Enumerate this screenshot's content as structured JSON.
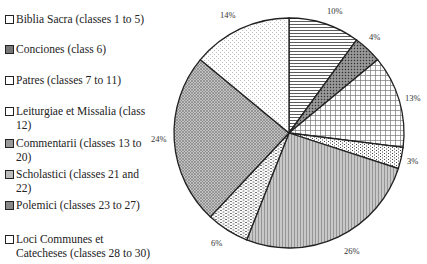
{
  "chart_data": {
    "type": "pie",
    "title": "",
    "start_angle": "12 o'clock, clockwise",
    "legend_position": "left",
    "slices": [
      {
        "label": "Biblia Sacra (classes 1 to 5)",
        "value": 10,
        "value_label": "10%",
        "pattern": "horizontal-lines",
        "swatch": "#ffffff"
      },
      {
        "label": "Conciones (class 6)",
        "value": 4,
        "value_label": "4%",
        "pattern": "dark-dots",
        "swatch": "#777777"
      },
      {
        "label": "Patres (classes 7 to 11)",
        "value": 13,
        "value_label": "13%",
        "pattern": "grid",
        "swatch": "#ffffff"
      },
      {
        "label": "Leiturgiae et Missalia (class 12)",
        "value": 3,
        "value_label": "3%",
        "pattern": "dots",
        "swatch": "#ffffff"
      },
      {
        "label": "Commentarii (classes 13 to 20)",
        "value": 26,
        "value_label": "26%",
        "pattern": "vertical-lines",
        "swatch": "#999999"
      },
      {
        "label": "Scholastici (classes 21 and 22)",
        "value": 6,
        "value_label": "6%",
        "pattern": "dashes",
        "swatch": "#bbbbbb"
      },
      {
        "label": "Polemici (classes 23 to 27)",
        "value": 24,
        "value_label": "24%",
        "pattern": "crosshatch",
        "swatch": "#888888"
      },
      {
        "label": "Loci Communes et Catecheses (classes 28 to 30)",
        "value": 14,
        "value_label": "14%",
        "pattern": "light-dots",
        "swatch": "#ffffff"
      }
    ]
  },
  "legend": {
    "items": [
      {
        "label": "Biblia Sacra (classes 1 to 5)"
      },
      {
        "label": "Conciones (class 6)"
      },
      {
        "label": "Patres (classes 7 to 11)"
      },
      {
        "label": "Leiturgiae et Missalia (class 12)"
      },
      {
        "label": "Commentarii (classes 13 to 20)"
      },
      {
        "label": "Scholastici (classes 21 and 22)"
      },
      {
        "label": "Polemici (classes 23 to 27)"
      },
      {
        "label": "Loci Communes et Catecheses (classes 28 to 30)"
      }
    ]
  },
  "labels": {
    "l0": "10%",
    "l1": "4%",
    "l2": "13%",
    "l3": "3%",
    "l4": "26%",
    "l5": "6%",
    "l6": "24%",
    "l7": "14%"
  }
}
